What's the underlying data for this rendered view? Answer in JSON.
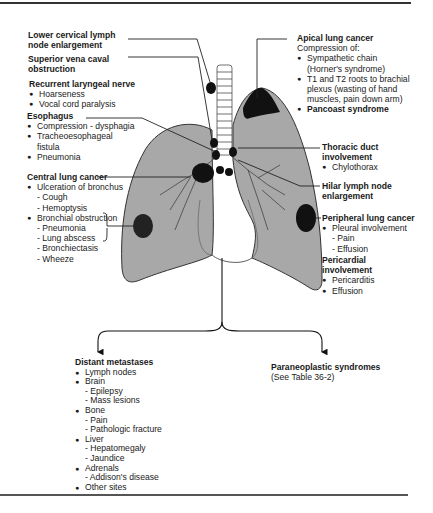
{
  "figure": {
    "colors": {
      "lung_fill": "#a8a8a8",
      "tumor": "#111111",
      "rule": "#333333",
      "text": "#1a1a1a"
    }
  },
  "left_labels": {
    "lower_cervical": {
      "title_line1": "Lower cervical lymph",
      "title_line2": "node enlargement"
    },
    "svc": {
      "title_line1": "Superior vena caval",
      "title_line2": "obstruction"
    },
    "recurrent_laryngeal": {
      "title": "Recurrent laryngeal nerve",
      "items": [
        "Hoarseness",
        "Vocal cord paralysis"
      ]
    },
    "esophagus": {
      "title": "Esophagus",
      "items": [
        "Compression - dysphagia",
        "Tracheoesophageal",
        "fistula",
        "Pneumonia"
      ]
    },
    "central_lung_cancer": {
      "title": "Central lung cancer",
      "b1": "Ulceration of bronchus",
      "b1_subs": [
        "- Cough",
        "- Hemoptysis"
      ],
      "b2": "Bronchial obstruction",
      "b2_subs": [
        "- Pneumonia",
        "- Lung abscess",
        "- Bronchiectasis",
        "- Wheeze"
      ]
    }
  },
  "right_labels": {
    "apical": {
      "title": "Apical lung cancer",
      "intro": "Compression of:",
      "items": [
        "Sympathetic chain",
        "(Horner's syndrome)",
        "T1 and T2 roots to brachial",
        "plexus (wasting of hand",
        "muscles, pain down arm)"
      ],
      "bold_item": "Pancoast syndrome"
    },
    "thoracic_duct": {
      "title_line1": "Thoracic duct",
      "title_line2": "involvement",
      "items": [
        "Chylothorax"
      ]
    },
    "hilar": {
      "title_line1": "Hilar lymph node",
      "title_line2": "enlargement"
    },
    "peripheral": {
      "title": "Peripheral lung cancer",
      "b1": "Pleural involvement",
      "subs": [
        "- Pain",
        "- Effusion"
      ]
    },
    "pericardial": {
      "title_line1": "Pericardial",
      "title_line2": "involvement",
      "items": [
        "Pericarditis",
        "Effusion"
      ]
    }
  },
  "bottom_labels": {
    "distant": {
      "title": "Distant metastases",
      "rows": [
        {
          "type": "b",
          "text": "Lymph nodes"
        },
        {
          "type": "b",
          "text": "Brain"
        },
        {
          "type": "d",
          "text": "- Epilepsy"
        },
        {
          "type": "d",
          "text": "- Mass lesions"
        },
        {
          "type": "b",
          "text": "Bone"
        },
        {
          "type": "d",
          "text": "- Pain"
        },
        {
          "type": "d",
          "text": "- Pathologic fracture"
        },
        {
          "type": "b",
          "text": "Liver"
        },
        {
          "type": "d",
          "text": "- Hepatomegaly"
        },
        {
          "type": "d",
          "text": "- Jaundice"
        },
        {
          "type": "b",
          "text": "Adrenals"
        },
        {
          "type": "d",
          "text": "- Addison's disease"
        },
        {
          "type": "b",
          "text": "Other sites"
        }
      ]
    },
    "paraneoplastic": {
      "title": "Paraneoplastic syndromes",
      "note": "(See Table 36-2)"
    }
  }
}
